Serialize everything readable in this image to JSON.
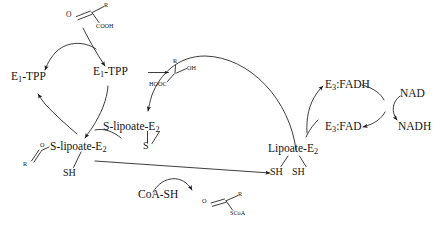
{
  "diagram": {
    "stroke_color": "#1a1a1a",
    "background_color": "#ffffff"
  },
  "labels": {
    "keto_acid": {
      "oxygen": "O",
      "r_group": "R",
      "carboxyl": "COOH"
    },
    "e1_tpp_free": {
      "prefix": "E",
      "subscript": "1",
      "suffix": "-TPP"
    },
    "e1_tpp_bound": {
      "prefix": "E",
      "subscript": "1",
      "suffix": "-TPP"
    },
    "hydroxy_intermediate": {
      "r_group": "R",
      "hydroxyl": "OH",
      "carboxyl": "HOOC"
    },
    "s_lipoate_e2_disulfide": {
      "prefix": "S-lipoate-E",
      "subscript": "2",
      "sulfur": "S"
    },
    "acyl_s_lipoate_e2": {
      "oxygen": "O",
      "r_group": "R",
      "prefix": "S-lipoate-E",
      "subscript": "2",
      "thiol": "SH"
    },
    "coa_sh": "CoA-SH",
    "acyl_coa": {
      "oxygen": "O",
      "r_group": "R",
      "thioester": "SCoA"
    },
    "lipoate_e2": {
      "prefix": "Lipoate-E",
      "subscript": "2",
      "thiol_left": "SH",
      "thiol_right": "SH"
    },
    "e3_fadh": {
      "prefix": "E",
      "subscript": "3",
      "suffix": ":FADH"
    },
    "e3_fad": {
      "prefix": "E",
      "subscript": "3",
      "suffix": ":FAD"
    },
    "nad": "NAD",
    "nadh": "NADH"
  }
}
